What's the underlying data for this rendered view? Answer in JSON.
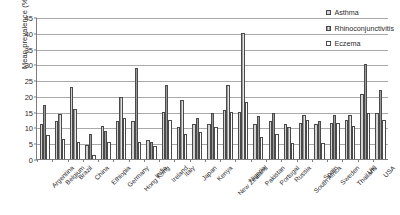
{
  "chart_data": {
    "type": "bar",
    "title": "",
    "xlabel": "",
    "ylabel": "Mean prevalence (%)",
    "ylim": [
      0,
      45
    ],
    "ytick_step": 5,
    "yticks": [
      0,
      5,
      10,
      15,
      20,
      25,
      30,
      35,
      40,
      45
    ],
    "grid": true,
    "legend_position": "top-right",
    "categories": [
      "Argentina",
      "Belgium",
      "Brazil",
      "China",
      "Ethiopia",
      "Germany",
      "Hong Kong",
      "India",
      "Ireland",
      "Italy",
      "Japan",
      "Kenya",
      "New Zealand",
      "Nigeria",
      "Pakistan",
      "Portugal",
      "Russia",
      "South Africa",
      "Spain",
      "Sweden",
      "Thailand",
      "UK",
      "USA"
    ],
    "series": [
      {
        "name": "Asthma",
        "color": "#d3d3d3",
        "values": [
          11.0,
          12.0,
          22.7,
          4.5,
          10.5,
          12.0,
          12.0,
          6.0,
          15.0,
          10.0,
          11.0,
          11.0,
          15.5,
          15.0,
          11.0,
          12.0,
          11.0,
          11.5,
          11.0,
          11.5,
          12.5,
          20.5,
          14.5
        ]
      },
      {
        "name": "Rhinoconjunctivitis",
        "color": "#9a9a9a",
        "values": [
          17.2,
          14.4,
          16.0,
          8.0,
          9.0,
          19.7,
          28.8,
          5.5,
          23.5,
          18.6,
          13.0,
          14.5,
          23.6,
          40.0,
          13.5,
          14.5,
          10.0,
          14.0,
          12.0,
          14.0,
          14.0,
          30.0,
          22.0
        ]
      },
      {
        "name": "Eczema",
        "color": "#ffffff",
        "values": [
          7.5,
          6.5,
          5.3,
          1.2,
          5.5,
          13.0,
          5.5,
          4.0,
          12.5,
          8.0,
          8.5,
          10.0,
          15.0,
          18.0,
          7.0,
          8.0,
          5.0,
          12.5,
          5.0,
          11.5,
          10.5,
          14.5,
          12.5
        ]
      }
    ]
  },
  "legend": {
    "items": [
      {
        "label": "Asthma"
      },
      {
        "label": "Rhinoconjunctivitis"
      },
      {
        "label": "Eczema"
      }
    ]
  }
}
